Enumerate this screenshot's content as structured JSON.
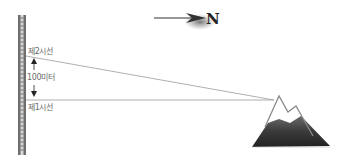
{
  "diagram": {
    "north_label": "N",
    "upper_line_label": "제2시선",
    "distance_label": "100미터",
    "lower_line_label": "제1시선",
    "icons": {
      "north_arrow": "arrow-right-icon",
      "mountain": "mountain-icon",
      "pole": "measuring-pole-icon"
    },
    "colors": {
      "pole_dark": "#6e6e6e",
      "pole_light": "#d8d8d8",
      "sight_line": "#9a9a9a",
      "mountain_dark": "#3c3c3c",
      "mountain_outline": "#8a8a8a"
    }
  }
}
